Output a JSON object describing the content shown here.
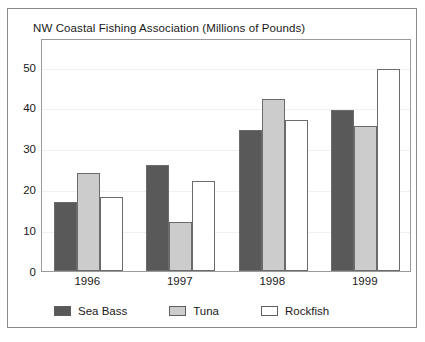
{
  "chart_data": {
    "type": "bar",
    "title": "NW Coastal Fishing Association (Millions of Pounds)",
    "xlabel": "",
    "ylabel": "",
    "categories": [
      "1996",
      "1997",
      "1998",
      "1999"
    ],
    "series": [
      {
        "name": "Sea Bass",
        "color": "#595959",
        "values": [
          17,
          26,
          34.5,
          39.5
        ]
      },
      {
        "name": "Tuna",
        "color": "#cccccc",
        "values": [
          24,
          12,
          42,
          35.5
        ]
      },
      {
        "name": "Rockfish",
        "color": "#ffffff",
        "values": [
          18,
          22,
          37,
          49.5
        ]
      }
    ],
    "ylim": [
      0,
      57
    ],
    "yticks": [
      0,
      10,
      20,
      30,
      40,
      50
    ],
    "ytick_labels": [
      "0",
      "10",
      "20",
      "30",
      "40",
      "50"
    ],
    "grid": true,
    "legend_position": "bottom-left",
    "bar_border_color": "#6b6b6b",
    "frame_color": "#9a9a9a",
    "card_border_color": "#8a8a8a",
    "gridline_color": "#f0f0f0",
    "text_color": "#1a1a1a"
  }
}
